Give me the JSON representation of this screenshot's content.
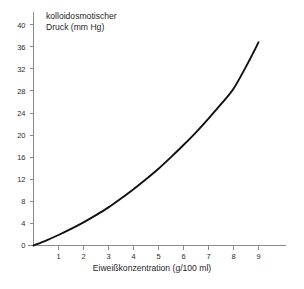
{
  "chart_data": {
    "type": "line",
    "title": "kolloidosmotischer Druck (mm Hg)",
    "title_line1": "kolloidosmotischer",
    "title_line2": "Druck (mm Hg)",
    "xlabel": "Eiweißkonzentration (g/100 ml)",
    "ylabel": "kolloidosmotischer Druck (mm Hg)",
    "xlim": [
      0,
      10
    ],
    "ylim": [
      0,
      41
    ],
    "grid": false,
    "legend": null,
    "xticks": [
      1,
      2,
      3,
      4,
      5,
      6,
      7,
      8,
      9
    ],
    "xtick_labels": [
      "1",
      "2",
      "3",
      "4",
      "5",
      "6",
      "7",
      "8",
      "9"
    ],
    "yticks": [
      0,
      4,
      8,
      12,
      16,
      20,
      24,
      28,
      32,
      36,
      40
    ],
    "ytick_labels": [
      "0",
      "4",
      "8",
      "12",
      "16",
      "20",
      "24",
      "28",
      "32",
      "36",
      "40"
    ],
    "series": [
      {
        "name": "kolloidosmotischer Druck",
        "color": "#101010",
        "x": [
          0,
          0.5,
          1,
          1.5,
          2,
          2.5,
          3,
          3.5,
          4,
          4.5,
          5,
          5.5,
          6,
          6.5,
          7,
          7.5,
          8,
          8.5,
          9
        ],
        "y": [
          0,
          0.9,
          1.9,
          3.0,
          4.2,
          5.5,
          6.9,
          8.5,
          10.2,
          12.0,
          13.9,
          16.0,
          18.2,
          20.5,
          23.0,
          25.6,
          28.4,
          32.4,
          36.8
        ]
      }
    ],
    "axis_color": "#8a8a8a",
    "curve_color": "#101010",
    "background_color": "#ffffff"
  }
}
